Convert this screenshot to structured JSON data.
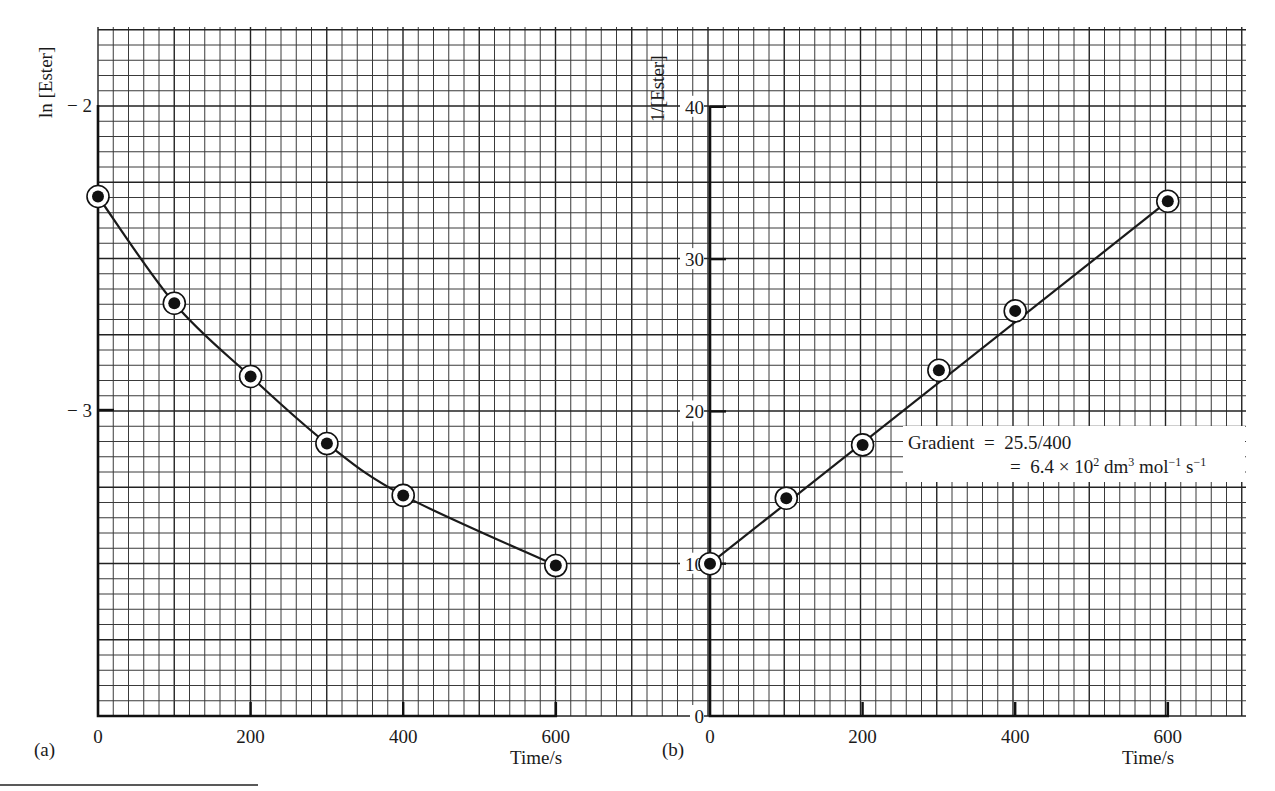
{
  "chart_data": [
    {
      "panel": "(a)",
      "type": "line",
      "title": "",
      "xlabel": "Time/s",
      "ylabel": "ln [Ester]",
      "x_ticks": [
        0,
        200,
        400,
        600
      ],
      "y_ticks": [
        -2,
        -3
      ],
      "xlim": [
        0,
        600
      ],
      "ylim": [
        -4,
        -1.75
      ],
      "grid": true,
      "fit": "smooth curve",
      "series": [
        {
          "name": "ln [Ester]",
          "x": [
            0,
            100,
            200,
            300,
            400,
            600
          ],
          "values": [
            -2.3,
            -2.65,
            -2.89,
            -3.11,
            -3.28,
            -3.51
          ]
        }
      ]
    },
    {
      "panel": "(b)",
      "type": "line",
      "title": "",
      "xlabel": "Time/s",
      "ylabel": "1/[Ester]",
      "x_ticks": [
        0,
        200,
        400,
        600
      ],
      "y_ticks": [
        0,
        10,
        20,
        30,
        40
      ],
      "xlim": [
        0,
        600
      ],
      "ylim": [
        0,
        45
      ],
      "grid": true,
      "fit": "straight line",
      "series": [
        {
          "name": "1/[Ester]",
          "x": [
            0,
            100,
            200,
            300,
            400,
            600
          ],
          "values": [
            10.0,
            14.3,
            17.8,
            22.7,
            26.6,
            33.8
          ]
        }
      ],
      "annotation": {
        "line1": "Gradient  =  25.5/400",
        "line2_prefix": "=  6.4 × 10",
        "line2_exp": "2",
        "line2_unit1": " dm",
        "line2_exp2": "3",
        "line2_unit2": " mol",
        "line2_exp3": "−1",
        "line2_unit3": " s",
        "line2_exp4": "−1"
      }
    }
  ],
  "labels": {
    "panel_a": "(a)",
    "panel_b": "(b)",
    "a_ylabel": "ln [Ester]",
    "b_ylabel": "1/[Ester]",
    "a_xlabel": "Time/s",
    "b_xlabel": "Time/s",
    "a_yticks": [
      "− 2",
      "− 3"
    ],
    "b_yticks": [
      "0",
      "10",
      "20",
      "30",
      "40"
    ],
    "xticks": [
      "0",
      "200",
      "400",
      "600"
    ]
  }
}
